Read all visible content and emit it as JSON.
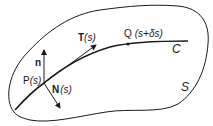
{
  "diagram": {
    "surface_label": "S",
    "curve_label": "C",
    "point_p": {
      "label_main": "P",
      "label_arg": "(s)"
    },
    "point_q": {
      "label_main": "Q",
      "label_arg": "(s+δs)"
    },
    "tangent": {
      "label_main": "T",
      "label_arg": "(s)"
    },
    "surface_normal": {
      "label_main": "n"
    },
    "curve_normal": {
      "label_main": "N",
      "label_arg": "(s)"
    }
  },
  "colors": {
    "stroke": "#1a1a1a",
    "background": "#ffffff"
  }
}
